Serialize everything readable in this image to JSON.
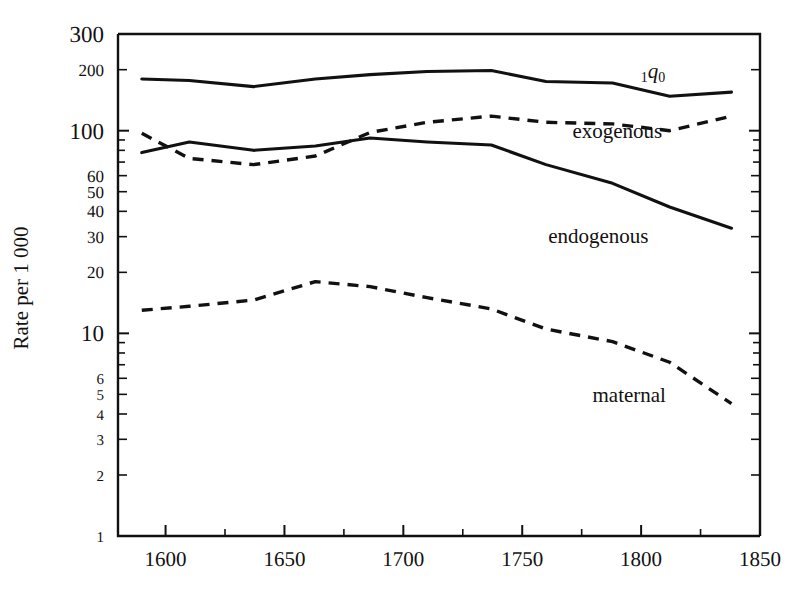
{
  "chart_data": {
    "type": "line",
    "title": "",
    "xlabel": "",
    "ylabel": "Rate per 1 000",
    "xlim": [
      1580,
      1850
    ],
    "ylim": [
      1,
      300
    ],
    "yscale": "log",
    "xscale": "linear",
    "grid": false,
    "legend_position": "inline-annotations",
    "x_ticks_major": [
      1600,
      1650,
      1700,
      1750,
      1800,
      1850
    ],
    "x_tick_labels": [
      "1600",
      "1650",
      "1700",
      "1750",
      "1800",
      "1850"
    ],
    "x_ticks_minor": [
      1625,
      1675,
      1725,
      1775,
      1825
    ],
    "y_ticks": [
      1,
      2,
      3,
      4,
      5,
      6,
      10,
      20,
      30,
      40,
      50,
      60,
      100,
      200,
      300
    ],
    "y_tick_labels": [
      "1",
      "2",
      "3",
      "4",
      "5",
      "6",
      "10",
      "20",
      "30",
      "40",
      "50",
      "60",
      "100",
      "200",
      "300"
    ],
    "y_ticks_unlabeled": [
      7,
      8,
      9,
      70,
      80,
      90
    ],
    "series": [
      {
        "name": "1q0",
        "label": "₁q₀",
        "style": "solid",
        "label_x": 1805,
        "label_y": 182,
        "x": [
          1590,
          1610,
          1637,
          1663,
          1686,
          1710,
          1737,
          1760,
          1788,
          1812,
          1838
        ],
        "values": [
          180,
          177,
          165,
          180,
          189,
          196,
          198,
          175,
          172,
          148,
          155
        ]
      },
      {
        "name": "exogenous",
        "label": "exogenous",
        "style": "dashed",
        "label_x": 1790,
        "label_y": 92,
        "x": [
          1590,
          1610,
          1637,
          1663,
          1686,
          1710,
          1737,
          1760,
          1788,
          1812,
          1838
        ],
        "values": [
          97,
          73,
          68,
          75,
          98,
          110,
          118,
          110,
          108,
          100,
          118
        ]
      },
      {
        "name": "endogenous",
        "label": "endogenous",
        "style": "solid",
        "label_x": 1782,
        "label_y": 28,
        "x": [
          1590,
          1610,
          1637,
          1663,
          1686,
          1710,
          1737,
          1760,
          1788,
          1812,
          1838
        ],
        "values": [
          78,
          88,
          80,
          84,
          92,
          88,
          85,
          68,
          55,
          42,
          33
        ]
      },
      {
        "name": "maternal",
        "label": "maternal",
        "style": "dashed",
        "label_x": 1795,
        "label_y": 4.6,
        "x": [
          1590,
          1610,
          1637,
          1663,
          1686,
          1710,
          1737,
          1760,
          1788,
          1812,
          1838
        ],
        "values": [
          13,
          13.6,
          14.6,
          18,
          17,
          15,
          13.2,
          10.5,
          9.1,
          7.2,
          4.5
        ]
      }
    ]
  }
}
